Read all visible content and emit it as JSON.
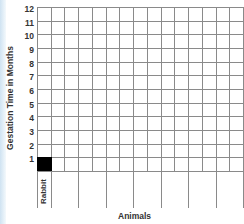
{
  "chart_data": {
    "type": "bar",
    "title": "",
    "xlabel": "Animals",
    "ylabel": "Gestation Time in Months",
    "categories": [
      "Rabbit",
      "",
      "",
      "",
      "",
      "",
      "",
      ""
    ],
    "values": [
      1,
      null,
      null,
      null,
      null,
      null,
      null,
      null
    ],
    "yticks": [
      "1",
      "2",
      "3",
      "4",
      "5",
      "6",
      "7",
      "8",
      "9",
      "10",
      "11",
      "12"
    ],
    "ylim": [
      0,
      12
    ],
    "grid": true,
    "bar_color": "#000000"
  }
}
